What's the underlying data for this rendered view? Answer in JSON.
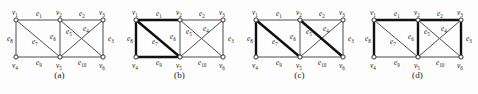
{
  "figure": {
    "background_color": "#fdfdfd",
    "edge_color": "#4d4d4d",
    "edge_bold_color": "#111111",
    "vertex_fill": "#ffffff",
    "vertex_stroke": "#333333",
    "label_color": "#1a1a1a"
  },
  "graph": {
    "vertices": [
      {
        "id": "v1",
        "base": "v",
        "sub": "1",
        "x": 16,
        "y": 20,
        "label_dx": -4,
        "label_dy": -5
      },
      {
        "id": "v2",
        "base": "v",
        "sub": "2",
        "x": 60,
        "y": 20,
        "label_dx": -4,
        "label_dy": -5
      },
      {
        "id": "v3",
        "base": "v",
        "sub": "3",
        "x": 103,
        "y": 20,
        "label_dx": -4,
        "label_dy": -5
      },
      {
        "id": "v4",
        "base": "v",
        "sub": "4",
        "x": 16,
        "y": 57,
        "label_dx": -4,
        "label_dy": 11
      },
      {
        "id": "v5",
        "base": "v",
        "sub": "5",
        "x": 60,
        "y": 57,
        "label_dx": -4,
        "label_dy": 11
      },
      {
        "id": "v6",
        "base": "v",
        "sub": "6",
        "x": 103,
        "y": 57,
        "label_dx": -4,
        "label_dy": 11
      }
    ],
    "edges": [
      {
        "id": "e1",
        "base": "e",
        "sub": "1",
        "from": "v1",
        "to": "v2",
        "label_x": 36,
        "label_y": 16
      },
      {
        "id": "e2",
        "base": "e",
        "sub": "2",
        "from": "v2",
        "to": "v3",
        "label_x": 79,
        "label_y": 16
      },
      {
        "id": "e3",
        "base": "e",
        "sub": "3",
        "from": "v3",
        "to": "v6",
        "label_x": 108,
        "label_y": 41
      },
      {
        "id": "e4",
        "base": "e",
        "sub": "4",
        "from": "v2",
        "to": "v6",
        "label_x": 83,
        "label_y": 31
      },
      {
        "id": "e5",
        "base": "e",
        "sub": "5",
        "from": "v3",
        "to": "v5",
        "label_x": 66,
        "label_y": 34
      },
      {
        "id": "e6",
        "base": "e",
        "sub": "6",
        "from": "v2",
        "to": "v5",
        "label_x": 50,
        "label_y": 39
      },
      {
        "id": "e7",
        "base": "e",
        "sub": "7",
        "from": "v1",
        "to": "v5",
        "label_x": 32,
        "label_y": 44
      },
      {
        "id": "e8",
        "base": "e",
        "sub": "8",
        "from": "v1",
        "to": "v4",
        "label_x": 7,
        "label_y": 41
      },
      {
        "id": "e9",
        "base": "e",
        "sub": "9",
        "from": "v4",
        "to": "v5",
        "label_x": 36,
        "label_y": 65
      },
      {
        "id": "e10",
        "base": "e",
        "sub": "10",
        "from": "v5",
        "to": "v6",
        "label_x": 78,
        "label_y": 65
      }
    ]
  },
  "panels": [
    {
      "id": "a",
      "caption": "(a)",
      "left": 0,
      "highlighted_edges": []
    },
    {
      "id": "b",
      "caption": "(b)",
      "left": 120,
      "highlighted_edges": [
        "e1",
        "e8",
        "e7",
        "e9"
      ]
    },
    {
      "id": "c",
      "caption": "(c)",
      "left": 240,
      "highlighted_edges": [
        "e8",
        "e7",
        "e4"
      ]
    },
    {
      "id": "d",
      "caption": "(d)",
      "left": 358,
      "highlighted_edges": [
        "e1",
        "e2",
        "e8",
        "e6",
        "e3"
      ]
    }
  ]
}
